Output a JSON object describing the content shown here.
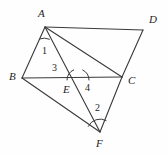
{
  "figure": {
    "kind": "geometry-diagram",
    "background_color": "#fefefe",
    "stroke_color": "#3a3a3a",
    "label_color": "#1d1d1d",
    "width": 168,
    "height": 154
  },
  "vertices": [
    {
      "id": "A",
      "label": "A",
      "x": 45,
      "y": 27,
      "label_x": 38,
      "label_y": 8
    },
    {
      "id": "D",
      "label": "D",
      "x": 143,
      "y": 30,
      "label_x": 149,
      "label_y": 14
    },
    {
      "id": "B",
      "label": "B",
      "x": 22,
      "y": 78,
      "label_x": 9,
      "label_y": 71
    },
    {
      "id": "C",
      "label": "C",
      "x": 122,
      "y": 77,
      "label_x": 128,
      "label_y": 75
    },
    {
      "id": "E",
      "label": "E",
      "x": 78,
      "y": 80,
      "label_x": 63,
      "label_y": 84
    },
    {
      "id": "F",
      "label": "F",
      "x": 100,
      "y": 132,
      "label_x": 96,
      "label_y": 138
    }
  ],
  "segments": [
    {
      "name": "segment-AB",
      "from": "A",
      "to": "B"
    },
    {
      "name": "segment-AD",
      "from": "A",
      "to": "D"
    },
    {
      "name": "segment-AC",
      "from": "A",
      "to": "C"
    },
    {
      "name": "segment-AF",
      "from": "A",
      "to": "F"
    },
    {
      "name": "segment-BC",
      "from": "B",
      "to": "C"
    },
    {
      "name": "segment-CD",
      "from": "C",
      "to": "D"
    },
    {
      "name": "segment-BF",
      "from": "B",
      "to": "F"
    },
    {
      "name": "segment-CF",
      "from": "C",
      "to": "F"
    }
  ],
  "angles": [
    {
      "id": "1",
      "label": "1",
      "at": "A",
      "label_x": 42,
      "label_y": 46,
      "arc": {
        "cx": 45,
        "cy": 27,
        "r": 13,
        "start_deg": 114,
        "end_deg": 70
      }
    },
    {
      "id": "3",
      "label": "3",
      "at": "E",
      "label_x": 52,
      "label_y": 63,
      "arc": {
        "cx": 78,
        "cy": 80,
        "r": 11,
        "start_deg": 180,
        "end_deg": 113
      }
    },
    {
      "id": "4",
      "label": "4",
      "at": "E",
      "label_x": 85,
      "label_y": 83,
      "arc": {
        "cx": 78,
        "cy": 80,
        "r": 11,
        "start_deg": 295,
        "end_deg": 360
      }
    },
    {
      "id": "2",
      "label": "2",
      "at": "F",
      "label_x": 95,
      "label_y": 103,
      "arc": {
        "cx": 100,
        "cy": 132,
        "r": 13,
        "start_deg": 206,
        "end_deg": 298
      }
    }
  ]
}
